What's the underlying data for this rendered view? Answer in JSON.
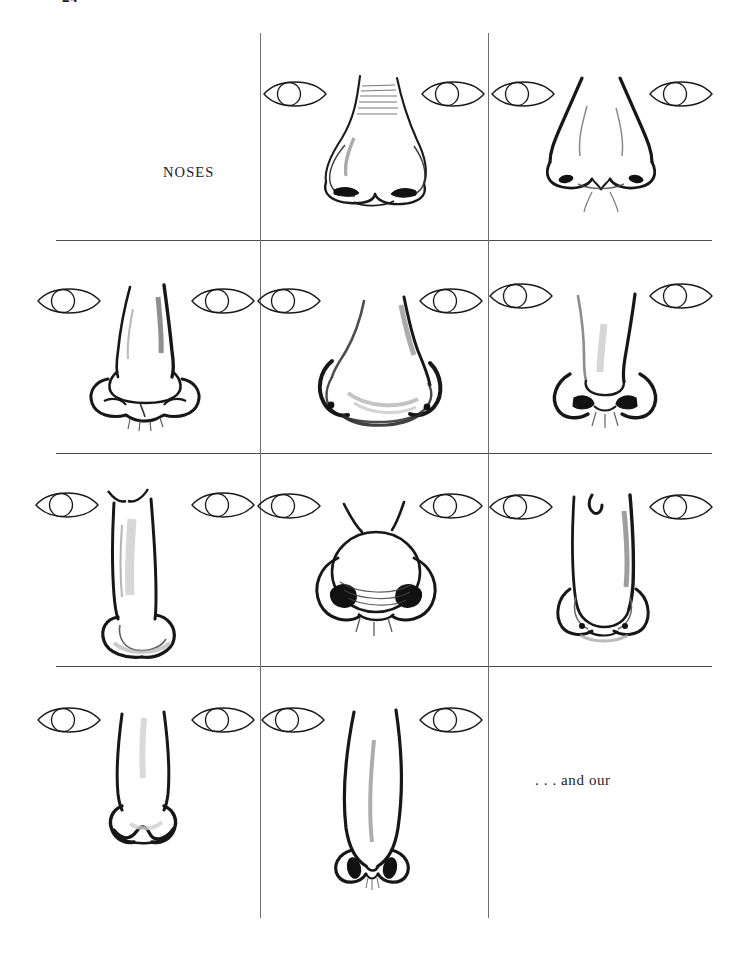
{
  "page": {
    "page_number": "24",
    "background_color": "#ffffff",
    "ink_color": "#1a1a1a",
    "rule_color": "#4a4a4a",
    "width": 739,
    "height": 954
  },
  "labels": {
    "section_label": "NOSES",
    "tail_text": ". . . and our"
  },
  "grid": {
    "vertical_rules": [
      {
        "x": 260,
        "y_top": 33,
        "y_bottom": 918
      },
      {
        "x": 488,
        "y_top": 33,
        "y_bottom": 918
      }
    ],
    "horizontal_rules": [
      {
        "y": 240,
        "x_left": 56,
        "x_right": 712
      },
      {
        "y": 453,
        "x_left": 56,
        "x_right": 712
      },
      {
        "y": 666,
        "x_left": 56,
        "x_right": 712
      }
    ],
    "columns": 3,
    "rows": 4
  },
  "plate": {
    "title": "NOSES",
    "description": "Reference plate of twelve hand-drawn noses arranged in a 4-row by 3-column grid, each flanked by a pair of simple almond-shaped eyes for scale.",
    "cells": [
      {
        "row": 1,
        "column": 1,
        "content": "label",
        "label": "NOSES",
        "has_drawing": false
      },
      {
        "row": 1,
        "column": 2,
        "content": "drawing",
        "nose_type": "broad-rounded-tip-nose",
        "has_eyes": true,
        "eyes": 2
      },
      {
        "row": 1,
        "column": 3,
        "content": "drawing",
        "nose_type": "flared-nostril-nose",
        "has_eyes": true,
        "eyes": 2
      },
      {
        "row": 2,
        "column": 1,
        "content": "drawing",
        "nose_type": "bulbous-ball-tip-nose",
        "has_eyes": true,
        "eyes": 2
      },
      {
        "row": 2,
        "column": 2,
        "content": "drawing",
        "nose_type": "wide-fleshy-nose",
        "has_eyes": true,
        "eyes": 2
      },
      {
        "row": 2,
        "column": 3,
        "content": "drawing",
        "nose_type": "narrow-upturned-nose",
        "has_eyes": true,
        "eyes": 2
      },
      {
        "row": 3,
        "column": 1,
        "content": "drawing",
        "nose_type": "long-straight-nose",
        "has_eyes": true,
        "eyes": 2
      },
      {
        "row": 3,
        "column": 2,
        "content": "drawing",
        "nose_type": "round-bulb-nose",
        "has_eyes": true,
        "eyes": 2
      },
      {
        "row": 3,
        "column": 3,
        "content": "drawing",
        "nose_type": "long-narrow-bridge-nose",
        "has_eyes": true,
        "eyes": 2
      },
      {
        "row": 4,
        "column": 1,
        "content": "drawing",
        "nose_type": "square-tip-nose",
        "has_eyes": true,
        "eyes": 2
      },
      {
        "row": 4,
        "column": 2,
        "content": "drawing",
        "nose_type": "thin-pointed-nose",
        "has_eyes": true,
        "eyes": 2
      },
      {
        "row": 4,
        "column": 3,
        "content": "text",
        "text": ". . . and our",
        "has_drawing": false
      }
    ]
  }
}
